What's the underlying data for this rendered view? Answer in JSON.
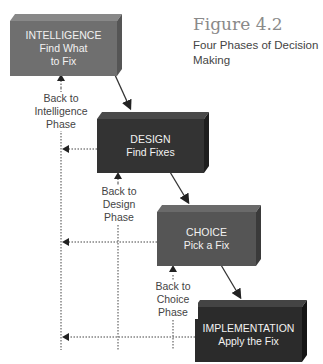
{
  "figure": {
    "title": "Figure 4.2",
    "subtitle_line1": "Four Phases of Decision",
    "subtitle_line2": "Making"
  },
  "phases": [
    {
      "name": "INTELLIGENCE",
      "desc_line1": "Find What",
      "desc_line2": "to Fix",
      "color": "#6f6f6f"
    },
    {
      "name": "DESIGN",
      "desc_line1": "Find Fixes",
      "color": "#333333"
    },
    {
      "name": "CHOICE",
      "desc_line1": "Pick a Fix",
      "color": "#555555"
    },
    {
      "name": "IMPLEMENTATION",
      "desc_line1": "Apply the Fix",
      "color": "#2b2b2b"
    }
  ],
  "feedback_labels": [
    {
      "line1": "Back to",
      "line2": "Intelligence",
      "line3": "Phase"
    },
    {
      "line1": "Back to",
      "line2": "Design",
      "line3": "Phase"
    },
    {
      "line1": "Back to",
      "line2": "Choice",
      "line3": "Phase"
    }
  ]
}
